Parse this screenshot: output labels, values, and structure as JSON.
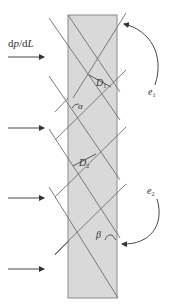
{
  "diagram": {
    "title_label": {
      "prefix": "d",
      "p": "p",
      "slash": "/d",
      "L": "L",
      "full": "dp/dL"
    },
    "labels": {
      "D1": {
        "main": "D",
        "sub": "1"
      },
      "D2": {
        "main": "D",
        "sub": "2"
      },
      "alpha": "α",
      "beta": "β",
      "e1": {
        "main": "e",
        "sub": "1"
      },
      "e2": {
        "main": "e",
        "sub": "2"
      }
    },
    "colors": {
      "slab_fill": "#d9d9d9",
      "slab_stroke": "#8a8a8a",
      "line": "#6e6e6e",
      "arrow": "#333333",
      "text": "#333333"
    },
    "pressure_arrows": [
      {
        "y": 57
      },
      {
        "y": 128
      },
      {
        "y": 198
      },
      {
        "y": 269
      }
    ],
    "slab": {
      "x": 68,
      "y": 15,
      "width": 49,
      "height": 283
    },
    "line_families": [
      {
        "name": "e1",
        "direction": "ascending",
        "count": 5
      },
      {
        "name": "e2",
        "direction": "descending",
        "count": 5
      }
    ]
  }
}
